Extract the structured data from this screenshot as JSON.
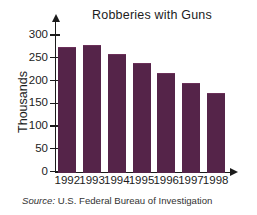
{
  "chart_data": {
    "type": "bar",
    "title": "Robberies with Guns",
    "xlabel": "",
    "ylabel": "Thousands",
    "categories": [
      "1992",
      "1993",
      "1994",
      "1995",
      "1996",
      "1997",
      "1998"
    ],
    "values": [
      273,
      279,
      259,
      239,
      216,
      195,
      172
    ],
    "ylim": [
      0,
      300
    ],
    "ytick_labels": [
      "300",
      "250",
      "200",
      "150",
      "100",
      "50",
      "0"
    ],
    "yticks": [
      300,
      250,
      200,
      150,
      100,
      50,
      0
    ],
    "grid": false,
    "legend": null,
    "bar_color": "#552449",
    "axis_color": "#1b1b1b"
  },
  "source": {
    "label": "Source:",
    "text": "U.S. Federal Bureau of Investigation"
  }
}
